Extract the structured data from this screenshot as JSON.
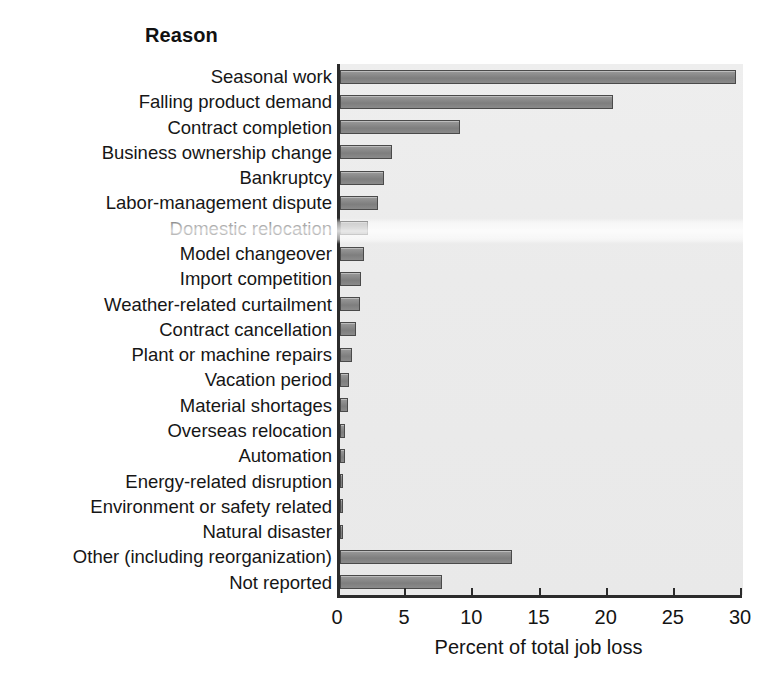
{
  "chart_data": {
    "type": "bar",
    "orientation": "horizontal",
    "title": "Reason",
    "xlabel": "Percent of total job loss",
    "ylabel": "",
    "xlim": [
      0,
      30
    ],
    "xticks": [
      0,
      5,
      10,
      15,
      20,
      25,
      30
    ],
    "xtick_labels": [
      "0",
      "5",
      "10",
      "15",
      "20",
      "25",
      "30"
    ],
    "grid": false,
    "legend": null,
    "categories": [
      "Seasonal work",
      "Falling product demand",
      "Contract completion",
      "Business ownership change",
      "Bankruptcy",
      "Labor-management dispute",
      "Domestic relocation",
      "Model changeover",
      "Import competition",
      "Weather-related curtailment",
      "Contract cancellation",
      "Plant or machine repairs",
      "Vacation period",
      "Material shortages",
      "Overseas relocation",
      "Automation",
      "Energy-related disruption",
      "Environment or safety related",
      "Natural disaster",
      "Other (including reorganization)",
      "Not reported"
    ],
    "values": [
      29.5,
      20.3,
      8.9,
      3.9,
      3.3,
      2.8,
      2.1,
      1.8,
      1.6,
      1.5,
      1.2,
      0.9,
      0.7,
      0.6,
      0.4,
      0.35,
      0.25,
      0.2,
      0.2,
      12.8,
      7.6
    ],
    "bar_color": "#8a8a8a",
    "bar_edge_color": "#4a4a4a",
    "plot_background": "#ececec",
    "axis_color": "#2b2b2b"
  }
}
